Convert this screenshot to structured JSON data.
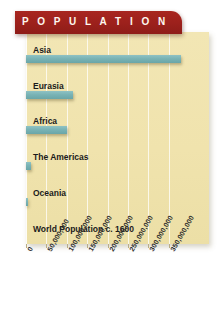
{
  "banner": {
    "title": "P O P U L A T I O N"
  },
  "colors": {
    "banner_red": "#9d211c",
    "panel_cream": "#f0e3ad",
    "bar_teal": "#79b3b5",
    "gridline": "#ffffff",
    "text": "#1b1b1b"
  },
  "chart_data": {
    "type": "bar",
    "orientation": "horizontal",
    "title": "P O P U L A T I O N",
    "xlabel": "",
    "ylabel": "",
    "categories": [
      "Asia",
      "Eurasia",
      "Africa",
      "The Americas",
      "Oceania",
      "World Population c. 1600"
    ],
    "values": [
      380000000,
      115000000,
      100000000,
      13000000,
      3000000,
      0
    ],
    "xlim": [
      0,
      380000000
    ],
    "xticks": [
      0,
      50000000,
      100000000,
      150000000,
      200000000,
      250000000,
      300000000,
      350000000
    ],
    "xticklabels": [
      "0",
      "50,000,000",
      "100,000,000",
      "150,000,000",
      "200,000,000",
      "250,000,000",
      "300,000,000",
      "350,000,000"
    ],
    "grid": true,
    "legend": false
  }
}
